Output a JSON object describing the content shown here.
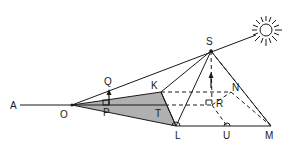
{
  "diagram": {
    "type": "geometry",
    "points": {
      "A": {
        "label": "A",
        "x": 20,
        "y": 105
      },
      "O": {
        "label": "O",
        "x": 72,
        "y": 105
      },
      "P": {
        "label": "P",
        "x": 107,
        "y": 105
      },
      "Q": {
        "label": "Q",
        "x": 108,
        "y": 90
      },
      "K": {
        "label": "K",
        "x": 161,
        "y": 92
      },
      "T": {
        "label": "T",
        "x": 165,
        "y": 105
      },
      "L": {
        "label": "L",
        "x": 176,
        "y": 126
      },
      "S": {
        "label": "S",
        "x": 211,
        "y": 51
      },
      "N": {
        "label": "N",
        "x": 231,
        "y": 92
      },
      "R": {
        "label": "R",
        "x": 212,
        "y": 105
      },
      "U": {
        "label": "U",
        "x": 227,
        "y": 126
      },
      "M": {
        "label": "M",
        "x": 271,
        "y": 126
      }
    },
    "sun": {
      "icon": "sun-icon",
      "x": 266,
      "y": 30
    },
    "shadow_fill": "#b0b0b0",
    "line_color": "#1a1a1a"
  }
}
